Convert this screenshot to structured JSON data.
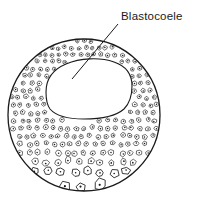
{
  "figure": {
    "kind": "biological-line-drawing",
    "background_color": "#ffffff",
    "ink_color": "#1a1a1a"
  },
  "annotations": {
    "blastocoele": {
      "label": "Blastocoele",
      "label_x": 121,
      "label_y": 20,
      "leader_from_x": 118,
      "leader_from_y": 24,
      "leader_to_x": 72,
      "leader_to_y": 79
    }
  },
  "embryo": {
    "outer_circle": {
      "cx": 84,
      "cy": 115,
      "r": 76
    },
    "cavity_label": "blastocoele cavity",
    "cavity_path": "M 46 92 C 46 78 54 69 66 64 C 80 58 100 57 114 62 C 126 66 132 75 132 86 C 132 96 129 104 124 109 C 116 116 100 119 84 119 C 68 119 56 116 50 109 C 47 105 46 99 46 92 Z",
    "wall_description": "multi-layered blastoderm of polygonal cells with dark nuclei",
    "vegetal_pole_description": "larger yolk-rich cells at bottom"
  }
}
